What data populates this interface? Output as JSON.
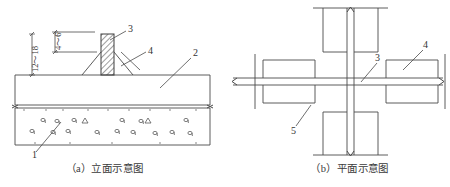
{
  "figure": {
    "title_note": "",
    "stroke_color": "#4a4a4a",
    "hatch_color": "#555555",
    "text_color": "#333333",
    "background": "#ffffff"
  },
  "panel_a": {
    "caption": "（a）立面示意图",
    "dimensions": [
      {
        "id": "dim-thickness",
        "text": "12～18"
      },
      {
        "id": "dim-gap",
        "text": "4～6"
      }
    ],
    "callouts": [
      {
        "id": "callout-1",
        "label": "1"
      },
      {
        "id": "callout-2",
        "label": "2"
      },
      {
        "id": "callout-3",
        "label": "3"
      },
      {
        "id": "callout-4",
        "label": "4"
      }
    ]
  },
  "panel_b": {
    "caption": "（b）平面示意图",
    "callouts": [
      {
        "id": "callout-3",
        "label": "3"
      },
      {
        "id": "callout-4",
        "label": "4"
      },
      {
        "id": "callout-5",
        "label": "5"
      }
    ]
  }
}
